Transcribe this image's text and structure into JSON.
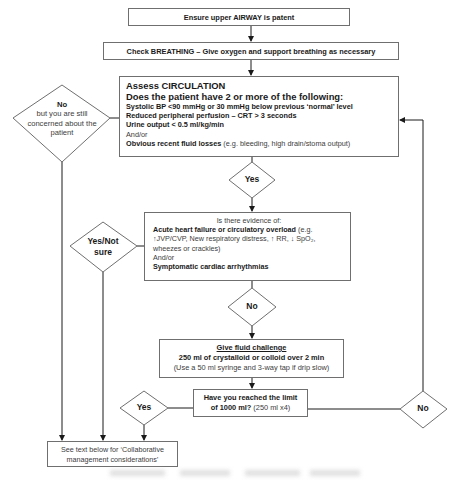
{
  "flowchart": {
    "airway": {
      "text": "Ensure upper AIRWAY is patent"
    },
    "breathing": {
      "text": "Check BREATHING – Give oxygen and support breathing as necessary"
    },
    "circulation": {
      "title": "Assess CIRCULATION",
      "question": "Does the patient have 2 or more of the following:",
      "criteria": [
        "Systolic BP <90 mmHg or 30 mmHg below previous ‘normal’ level",
        "Reduced peripheral perfusion – CRT > 3 seconds",
        "Urine output < 0.5 ml/kg/min"
      ],
      "andor": "And/or",
      "fluid_loss_bold": "Obvious recent fluid losses",
      "fluid_loss_detail": " (e.g. bleeding, high drain/stoma output)"
    },
    "no_concerned": {
      "label_bold": "No",
      "label_rest": "but you are still concerned about the patient"
    },
    "yes_1": {
      "label": "Yes"
    },
    "evidence": {
      "intro": "Is there evidence of:",
      "item1_bold": "Acute heart failure or circulatory overload",
      "item1_detail": " (e.g. ↑JVP/CVP, New respiratory distress, ↑ RR, ↓ SpO₂, wheezes or crackles)",
      "andor": "And/or",
      "item2_bold": "Symptomatic cardiac arrhythmias"
    },
    "yes_not_sure": {
      "label": "Yes/Not sure"
    },
    "no_1": {
      "label": "No"
    },
    "fluid_challenge": {
      "title": "Give fluid challenge",
      "dose": "250 ml of crystalloid or colloid over 2 min",
      "note": "(Use a 50 ml syringe and 3-way tap if drip slow)"
    },
    "limit": {
      "question_bold": "Have you reached the limit of 1000 ml?",
      "detail": "  (250 ml x4)"
    },
    "yes_2": {
      "label": "Yes"
    },
    "no_2": {
      "label": "No"
    },
    "see_text": {
      "text": "See text below for ‘Collaborative management considerations’"
    }
  },
  "colors": {
    "line": "#1a1a1a",
    "border": "#6f6f6f",
    "text": "#1a1a1a"
  }
}
